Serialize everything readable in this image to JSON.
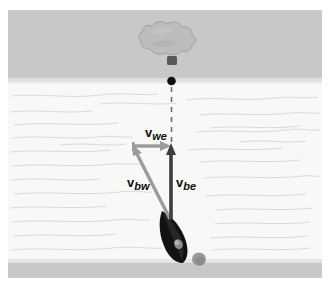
{
  "figure": {
    "canvas": {
      "width": 336,
      "height": 285
    }
  },
  "colors": {
    "background": "#ffffff",
    "land_band": "#c8c8c8",
    "water": "#f7f7f5",
    "water_line": "#c4c4cc",
    "arrow_dark": "#3a3a3a",
    "arrow_gray": "#9a9a9a",
    "boat_body": "#111111",
    "boat_wake": "#8e8e8e",
    "balloon": "#b9b9b9",
    "balloon_outline": "#9e9e9e",
    "basket": "#5a5a5a",
    "marker_dot": "#0d0d0d",
    "dashed_line": "#6e6e6e",
    "label_text": "#111111"
  },
  "scene": {
    "bands": [
      {
        "name": "far-bank",
        "label": "far bank (land)",
        "y": 10,
        "height": 70,
        "color": "#c8c8c8"
      },
      {
        "name": "river",
        "label": "river (water)",
        "y": 80,
        "height": 182,
        "color": "#f7f7f5"
      },
      {
        "name": "near-bank",
        "label": "near bank (land)",
        "y": 262,
        "height": 16,
        "color": "#c8c8c8"
      }
    ],
    "balloon": {
      "label": "balloon target",
      "cx": 172,
      "cy": 48
    },
    "marker_dot": {
      "label": "landing marker",
      "cx": 171,
      "cy": 81,
      "r": 4
    },
    "boat": {
      "label": "boat",
      "x": 171,
      "y": 220,
      "heading_deg": -27
    },
    "dashed_line": {
      "label": "line of sight to balloon",
      "x": 171,
      "y_top": 86,
      "y_bottom": 146
    }
  },
  "vectors": [
    {
      "id": "we",
      "name": "water-relative-to-earth",
      "symbol": "v",
      "subscript": "we",
      "label": "v_we",
      "color": "#9a9a9a",
      "from": {
        "x": 133,
        "y": 146
      },
      "to": {
        "x": 170,
        "y": 146
      },
      "direction": "right (downstream)",
      "label_pos": {
        "x": 145,
        "y": 126
      }
    },
    {
      "id": "bw",
      "name": "boat-relative-to-water",
      "symbol": "v",
      "subscript": "bw",
      "label": "v_bw",
      "color": "#9a9a9a",
      "from": {
        "x": 170,
        "y": 219
      },
      "to": {
        "x": 133,
        "y": 147
      },
      "direction": "up and to the left (upstream heading)",
      "label_pos": {
        "x": 127,
        "y": 176
      }
    },
    {
      "id": "be",
      "name": "boat-relative-to-earth",
      "symbol": "v",
      "subscript": "be",
      "label": "v_be",
      "color": "#3a3a3a",
      "from": {
        "x": 171,
        "y": 219
      },
      "to": {
        "x": 171,
        "y": 144
      },
      "direction": "straight up (across the river)",
      "label_pos": {
        "x": 176,
        "y": 176
      }
    }
  ],
  "labels": {
    "we": {
      "symbol": "v",
      "subscript": "we"
    },
    "bw": {
      "symbol": "v",
      "subscript": "bw"
    },
    "be": {
      "symbol": "v",
      "subscript": "be"
    }
  }
}
